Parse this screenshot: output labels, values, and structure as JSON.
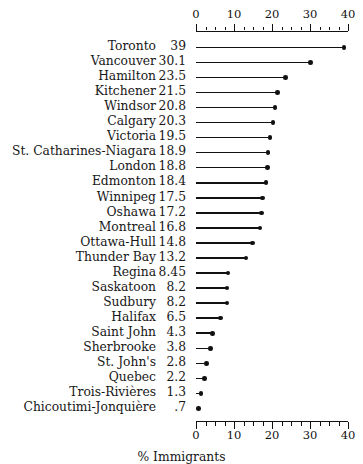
{
  "chart_data": {
    "type": "bar",
    "chart_style": "dot-plot",
    "title": "",
    "xlabel": "% Immigrants",
    "ylabel": "",
    "xlim": [
      0,
      40
    ],
    "ylim": null,
    "grid": false,
    "legend": null,
    "axis_position": "both-top-and-bottom",
    "x_major_ticks": [
      0,
      10,
      20,
      30,
      40
    ],
    "x_tick_labels": [
      "0",
      "10",
      "20",
      "30",
      "40"
    ],
    "x_minor_tick_step": 2.5,
    "value_labels_shown": true,
    "categories": [
      "Toronto",
      "Vancouver",
      "Hamilton",
      "Kitchener",
      "Windsor",
      "Calgary",
      "Victoria",
      "St. Catharines-Niagara",
      "London",
      "Edmonton",
      "Winnipeg",
      "Oshawa",
      "Montreal",
      "Ottawa-Hull",
      "Thunder Bay",
      "Regina",
      "Saskatoon",
      "Sudbury",
      "Halifax",
      "Saint John",
      "Sherbrooke",
      "St. John's",
      "Quebec",
      "Trois-Rivières",
      "Chicoutimi-Jonquière"
    ],
    "values": [
      39,
      30.1,
      23.5,
      21.5,
      20.8,
      20.3,
      19.5,
      18.9,
      18.8,
      18.4,
      17.5,
      17.2,
      16.8,
      14.8,
      13.2,
      8.45,
      8.2,
      8.2,
      6.5,
      4.3,
      3.8,
      2.8,
      2.2,
      1.3,
      0.7
    ],
    "value_labels": [
      "39",
      "30.1",
      "23.5",
      "21.5",
      "20.8",
      "20.3",
      "19.5",
      "18.9",
      "18.8",
      "18.4",
      "17.5",
      "17.2",
      "16.8",
      "14.8",
      "13.2",
      "8.45",
      "8.2",
      "8.2",
      "6.5",
      "4.3",
      "3.8",
      "2.8",
      "2.2",
      "1.3",
      ".7"
    ],
    "colors": {
      "marker": "#111111",
      "line": "#111111",
      "axis": "#111111",
      "text": "#171717",
      "background": "#ffffff"
    }
  }
}
